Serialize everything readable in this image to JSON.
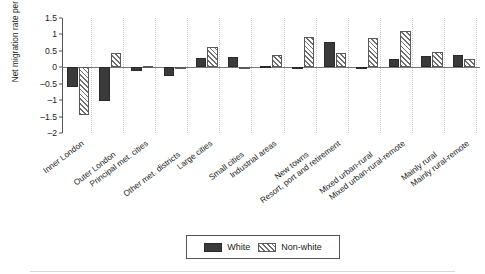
{
  "chart_data": {
    "type": "bar",
    "title": "",
    "subtitle": "",
    "xlabel": "",
    "ylabel": "Net migration rate per cent",
    "ylim": [
      -2,
      1.5
    ],
    "yticks": [
      1.5,
      1,
      0.5,
      0,
      -0.5,
      -1,
      -1.5,
      -2
    ],
    "ytick_labels": [
      "1.5",
      "1",
      "0.5",
      "0",
      "-0.5",
      "-1",
      "-1.5",
      "-2"
    ],
    "grid": "dotted vertical category separators",
    "legend_position": "bottom-center",
    "categories": [
      "Inner London",
      "Outer London",
      "Principal met. cities",
      "Other met. districts",
      "Large cities",
      "Small cities",
      "Industrial areas",
      "New towns",
      "Resort, port and retirement",
      "Mixed urban-rural",
      "Mixed urban-rural-remote",
      "Mainly rural",
      "Mainly rural-remote"
    ],
    "series": [
      {
        "name": "White",
        "values": [
          -0.6,
          -1.03,
          -0.1,
          -0.27,
          0.29,
          0.31,
          0.03,
          -0.05,
          0.76,
          0.0,
          0.25,
          0.34,
          0.38
        ]
      },
      {
        "name": "Non-white",
        "values": [
          -1.45,
          0.45,
          0.05,
          -0.05,
          0.63,
          0.0,
          0.38,
          0.92,
          0.42,
          0.88,
          1.11,
          0.48,
          0.26
        ]
      }
    ]
  },
  "legend": {
    "entries": [
      {
        "label": "White",
        "swatch": "solid-dark-fill"
      },
      {
        "label": "Non-white",
        "swatch": "diagonal-hatch-fill"
      }
    ]
  },
  "axis": {
    "y_title": "Net migration rate per cent"
  }
}
